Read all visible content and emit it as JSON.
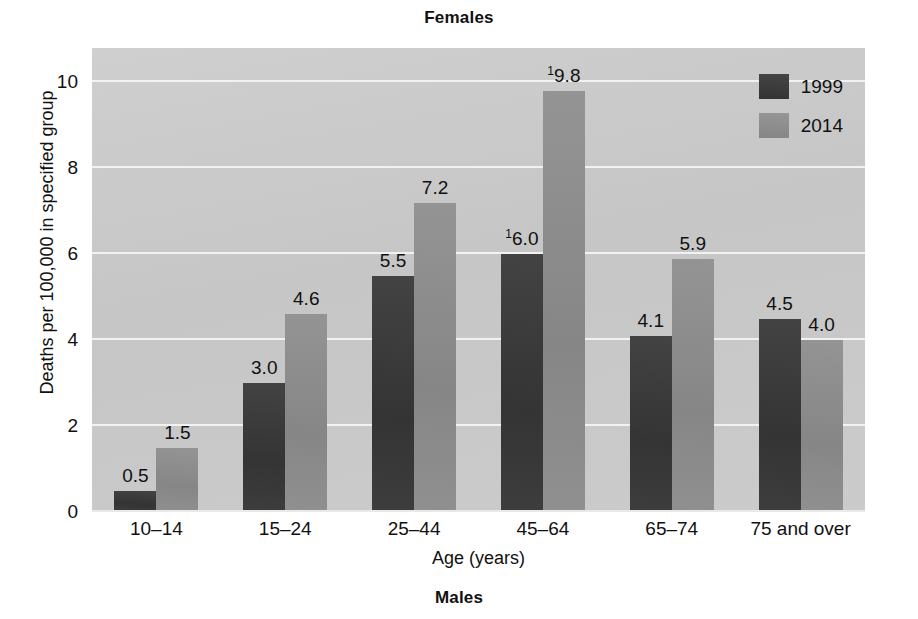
{
  "titles": {
    "top": "Females",
    "bottom": "Males"
  },
  "chart_data": {
    "type": "bar",
    "title": "Females",
    "subtitle": "Males",
    "xlabel": "Age (years)",
    "ylabel": "Deaths per 100,000 in specified group",
    "ylim": [
      0,
      10.8
    ],
    "yticks": [
      0,
      2,
      4,
      6,
      8,
      10
    ],
    "ytick_labels": [
      "0",
      "2",
      "4",
      "6",
      "8",
      "10"
    ],
    "grid": true,
    "legend_position": "top-right",
    "categories": [
      "10–14",
      "15–24",
      "25–44",
      "45–64",
      "65–74",
      "75 and over"
    ],
    "series": [
      {
        "name": "1999",
        "color": "#3b3b3b",
        "values": [
          0.5,
          3.0,
          5.5,
          6.0,
          4.1,
          4.5
        ],
        "labels": [
          "0.5",
          "3.0",
          "5.5",
          "6.0",
          "4.1",
          "4.5"
        ],
        "footnotes": [
          "",
          "",
          "",
          "1",
          "",
          ""
        ]
      },
      {
        "name": "2014",
        "color": "#8d8d8d",
        "values": [
          1.5,
          4.6,
          7.2,
          9.8,
          5.9,
          4.0
        ],
        "labels": [
          "1.5",
          "4.6",
          "7.2",
          "9.8",
          "5.9",
          "4.0"
        ],
        "footnotes": [
          "",
          "",
          "",
          "1",
          "",
          ""
        ]
      }
    ]
  },
  "legend": {
    "items": [
      {
        "label": "1999",
        "color": "#3b3b3b"
      },
      {
        "label": "2014",
        "color": "#8d8d8d"
      }
    ]
  }
}
